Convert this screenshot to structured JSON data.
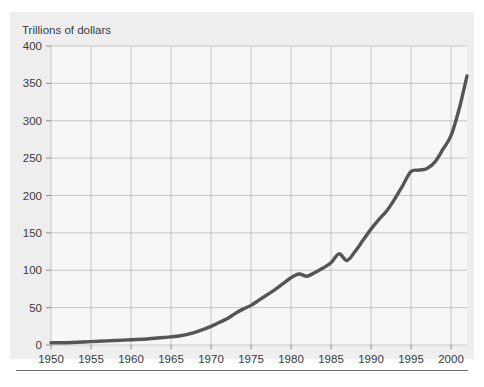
{
  "figure": {
    "axis_title": "Trillions of dollars",
    "line_color": "#555555",
    "grid_color": "#bfbfbf",
    "panel_color": "#eeeeee",
    "plot_bg": "#f7f7f7",
    "text_color": "#3a3a3a"
  },
  "chart_data": {
    "type": "line",
    "title": "",
    "subtitle": "",
    "xlabel": "",
    "ylabel": "Trillions of dollars",
    "ylim": [
      0,
      400
    ],
    "xlim": [
      1950,
      2002
    ],
    "grid": true,
    "legend": null,
    "yticks": [
      0,
      50,
      100,
      150,
      200,
      250,
      300,
      350,
      400
    ],
    "ytick_labels": [
      "0",
      "50",
      "100",
      "150",
      "200",
      "250",
      "300",
      "350",
      "400"
    ],
    "xticks": [
      1950,
      1955,
      1960,
      1965,
      1970,
      1975,
      1980,
      1985,
      1990,
      1995,
      2000
    ],
    "xtick_labels": [
      "1950",
      "1955",
      "1960",
      "1965",
      "1970",
      "1975",
      "1980",
      "1985",
      "1990",
      "1995",
      "2000"
    ],
    "series": [
      {
        "name": "Trillions of dollars",
        "color": "#555555",
        "x": [
          1950,
          1952,
          1954,
          1956,
          1958,
          1960,
          1962,
          1964,
          1966,
          1968,
          1970,
          1971,
          1972,
          1973,
          1974,
          1975,
          1976,
          1977,
          1978,
          1979,
          1980,
          1981,
          1982,
          1983,
          1984,
          1985,
          1986,
          1987,
          1988,
          1989,
          1990,
          1991,
          1992,
          1993,
          1994,
          1995,
          1996,
          1997,
          1998,
          1999,
          2000,
          2001,
          2002
        ],
        "values": [
          3,
          3,
          4,
          5,
          6,
          7,
          8,
          10,
          12,
          17,
          25,
          30,
          35,
          42,
          48,
          53,
          60,
          67,
          74,
          82,
          90,
          95,
          92,
          97,
          103,
          110,
          122,
          113,
          125,
          140,
          155,
          168,
          180,
          196,
          214,
          232,
          234,
          236,
          245,
          262,
          280,
          315,
          360
        ]
      }
    ]
  }
}
